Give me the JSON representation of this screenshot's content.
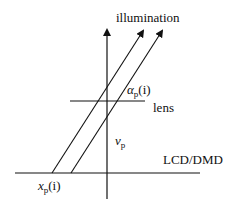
{
  "diagram": {
    "labels": {
      "illumination": "illumination",
      "alpha_symbol": "α",
      "alpha_sub": "p",
      "alpha_arg": "(i)",
      "lens": "lens",
      "v_symbol": "v",
      "v_sub": "p",
      "lcd": "LCD/DMD",
      "x_symbol": "x",
      "x_sub": "p",
      "x_arg": "(i)"
    },
    "colors": {
      "line": "#111111",
      "background": "#ffffff"
    }
  }
}
